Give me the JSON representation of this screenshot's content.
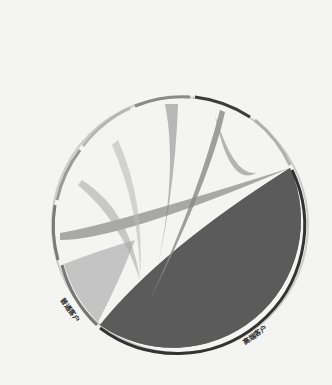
{
  "diagram": {
    "type": "chord",
    "groups": [
      {
        "label": "施工图设计",
        "color": "#9a9a9a"
      },
      {
        "label": "建筑方案设计",
        "color": "#7a7a7a"
      },
      {
        "label": "规划设计",
        "color": "#b5b5b5"
      },
      {
        "label": "景观设计",
        "color": "#a8a8a8"
      },
      {
        "label": "文旅项目规划设计",
        "color": "#8a8a8a"
      },
      {
        "label": "艺术街区规划设计",
        "color": "#3c3c3c"
      },
      {
        "label": "乡村振兴规划设计",
        "color": "#b0b0b0"
      }
    ],
    "targets": [
      {
        "label": "高端客户",
        "color": "#555555"
      },
      {
        "label": "普通客户",
        "color": "#b8b8b8"
      }
    ]
  }
}
